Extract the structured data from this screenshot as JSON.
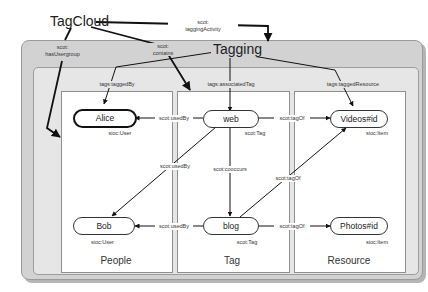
{
  "diagram": {
    "tagcloud": "TagCloud",
    "tagging": "Tagging",
    "edges": {
      "tagging_activity": [
        "scot:",
        "taggingActivity"
      ],
      "contains": [
        "scot:",
        "contains"
      ],
      "has_usergroup": [
        "scot:",
        "hasUsergroup"
      ],
      "tagged_by": "tags:taggedBy",
      "associated_tag": "tags:associatedTag",
      "tagged_resource": "tags:taggedResource",
      "web_used_by_alice": "scot:usedBy",
      "web_used_by_bob": "scot:usedBy",
      "blog_used_by_bob": "scot:usedBy",
      "cooccurs": "scot:cooccurs",
      "web_tag_of_videos": "scot:tagOf",
      "blog_tag_of_videos": "scot:tagOf",
      "blog_tag_of_photos": "scot:tagOf"
    },
    "nodes": {
      "alice": {
        "label": "Alice",
        "type": "sioc:User"
      },
      "bob": {
        "label": "Bob",
        "type": "sioc:User"
      },
      "web": {
        "label": "web",
        "type": "scot:Tag"
      },
      "blog": {
        "label": "blog",
        "type": "scot:Tag"
      },
      "videos": {
        "label": "Videos#id",
        "type": "sioc:Item"
      },
      "photos": {
        "label": "Photos#id",
        "type": "sioc:Item"
      }
    },
    "groups": {
      "people": "People",
      "tag": "Tag",
      "resource": "Resource"
    }
  }
}
